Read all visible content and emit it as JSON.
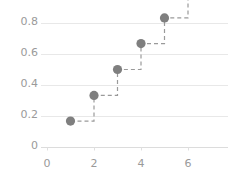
{
  "chart_data": {
    "type": "line",
    "variant": "step-post",
    "title": "",
    "xlabel": "",
    "ylabel": "",
    "x": [
      1,
      2,
      3,
      4,
      5,
      6
    ],
    "values": [
      0.167,
      0.333,
      0.5,
      0.667,
      0.833,
      1.0
    ],
    "series": [
      {
        "name": "step",
        "x": [
          1,
          2,
          3,
          4,
          5,
          6
        ],
        "values": [
          0.167,
          0.333,
          0.5,
          0.667,
          0.833,
          1.0
        ]
      }
    ],
    "markers": [
      {
        "x": 1,
        "y": 0.167
      },
      {
        "x": 2,
        "y": 0.333
      },
      {
        "x": 3,
        "y": 0.5
      },
      {
        "x": 4,
        "y": 0.667
      },
      {
        "x": 5,
        "y": 0.833
      }
    ],
    "xlim": [
      -0.35,
      6.6
    ],
    "ylim": [
      -0.03,
      0.97
    ],
    "xticks": [
      0,
      2,
      4,
      6
    ],
    "xticklabels": [
      "0",
      "2",
      "4",
      "6"
    ],
    "yticks": [
      0,
      0.2,
      0.4,
      0.6,
      0.8
    ],
    "yticklabels": [
      "0",
      "0.2",
      "0.4",
      "0.6",
      "0.8"
    ],
    "grid": true,
    "grid_axis": "y",
    "legend": false,
    "legend_position": "none",
    "colors": {
      "marker": "#7f7f7f",
      "line": "#9a9a9a",
      "grid": "#e8e8e8",
      "axis_text": "#9a9a9a",
      "background": "#ffffff"
    },
    "line_style": "dashed",
    "marker_style": "circle"
  }
}
